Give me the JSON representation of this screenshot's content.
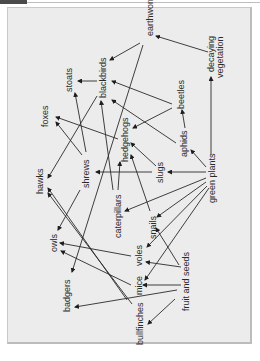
{
  "diagram": {
    "title": "",
    "nodes": [
      {
        "id": "earthworms",
        "label": "earthworms"
      },
      {
        "id": "decaying",
        "label": "decaying vegetation",
        "line1": "decaying",
        "line2": "vegetation"
      },
      {
        "id": "stoats",
        "label": "stoats"
      },
      {
        "id": "blackbirds",
        "label": "blackbirds"
      },
      {
        "id": "beetles",
        "label": "beetles"
      },
      {
        "id": "foxes",
        "label": "foxes"
      },
      {
        "id": "hedgehogs",
        "label": "hedgehogs"
      },
      {
        "id": "aphids",
        "label": "aphids"
      },
      {
        "id": "hawks",
        "label": "hawks"
      },
      {
        "id": "shrews",
        "label": "shrews"
      },
      {
        "id": "slugs",
        "label": "slugs"
      },
      {
        "id": "green_plants",
        "label": "green plants"
      },
      {
        "id": "caterpillars",
        "label": "caterpillars"
      },
      {
        "id": "snails",
        "label": "snails"
      },
      {
        "id": "owls",
        "label": "owls"
      },
      {
        "id": "voles",
        "label": "voles"
      },
      {
        "id": "badgers",
        "label": "badgers"
      },
      {
        "id": "mice",
        "label": "mice"
      },
      {
        "id": "fruit_seeds",
        "label": "fruit and seeds"
      },
      {
        "id": "bullfinches",
        "label": "bullfinches"
      }
    ],
    "edges": [
      [
        "decaying",
        "earthworms"
      ],
      [
        "earthworms",
        "blackbirds"
      ],
      [
        "earthworms",
        "badgers"
      ],
      [
        "blackbirds",
        "stoats"
      ],
      [
        "blackbirds",
        "hawks"
      ],
      [
        "beetles",
        "blackbirds"
      ],
      [
        "beetles",
        "hedgehogs"
      ],
      [
        "green_plants",
        "decaying"
      ],
      [
        "green_plants",
        "aphids"
      ],
      [
        "aphids",
        "beetles"
      ],
      [
        "aphids",
        "blackbirds"
      ],
      [
        "green_plants",
        "slugs"
      ],
      [
        "slugs",
        "shrews"
      ],
      [
        "slugs",
        "hedgehogs"
      ],
      [
        "hedgehogs",
        "foxes"
      ],
      [
        "shrews",
        "foxes"
      ],
      [
        "shrews",
        "stoats"
      ],
      [
        "shrews",
        "owls"
      ],
      [
        "caterpillars",
        "blackbirds"
      ],
      [
        "caterpillars",
        "hedgehogs"
      ],
      [
        "green_plants",
        "caterpillars"
      ],
      [
        "green_plants",
        "snails"
      ],
      [
        "green_plants",
        "voles"
      ],
      [
        "green_plants",
        "mice"
      ],
      [
        "snails",
        "hedgehogs"
      ],
      [
        "voles",
        "owls"
      ],
      [
        "mice",
        "owls"
      ],
      [
        "fruit_seeds",
        "voles"
      ],
      [
        "fruit_seeds",
        "mice"
      ],
      [
        "fruit_seeds",
        "bullfinches"
      ],
      [
        "fruit_seeds",
        "badgers"
      ],
      [
        "fruit_seeds",
        "snails"
      ],
      [
        "bullfinches",
        "hawks"
      ],
      [
        "mice",
        "hawks"
      ]
    ]
  }
}
